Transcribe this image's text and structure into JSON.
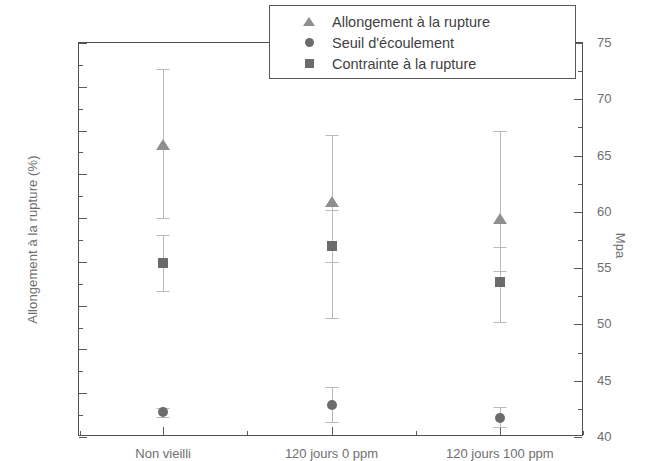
{
  "chart_data": {
    "type": "scatter",
    "title": "",
    "categories": [
      "Non vieilli",
      "120 jours 0 ppm",
      "120 jours 100 ppm"
    ],
    "left_axis": {
      "label": "Allongement à la rupture (%)",
      "ylim": [
        50,
        140
      ],
      "ticks": [
        50,
        60,
        70,
        80,
        90,
        100,
        110,
        120,
        130,
        140
      ],
      "tick_step": 10,
      "minor_per_major": 2
    },
    "right_axis": {
      "label": "Mpa",
      "ylim": [
        40,
        75
      ],
      "ticks": [
        40,
        45,
        50,
        55,
        60,
        65,
        70,
        75
      ],
      "tick_step": 5,
      "minor_per_major": 2
    },
    "grid": false,
    "legend_position": "top-center",
    "series": [
      {
        "name": "Allongement à la rupture",
        "marker": "triangle",
        "color": "#8f8f8f",
        "axis": "left",
        "values": [
          116.7,
          103.7,
          99.8
        ],
        "err_low": [
          16.7,
          13.7,
          11.8
        ],
        "err_high": [
          17.3,
          15.3,
          20.2
        ]
      },
      {
        "name": "Seuil d'écoulement",
        "marker": "circle",
        "color": "#6b6b6b",
        "axis": "right",
        "values": [
          42.2,
          42.8,
          41.7
        ],
        "err_low": [
          0.4,
          1.5,
          0.8
        ],
        "err_high": [
          0.4,
          1.6,
          1.0
        ]
      },
      {
        "name": "Contrainte à la rupture",
        "marker": "square",
        "color": "#6b6b6b",
        "axis": "right",
        "values": [
          55.5,
          57.0,
          53.8
        ],
        "err_low": [
          2.5,
          6.4,
          3.6
        ],
        "err_high": [
          2.4,
          3.2,
          3.1
        ]
      }
    ]
  },
  "legend": {
    "items": [
      {
        "label": "Allongement à la rupture",
        "marker": "triangle"
      },
      {
        "label": "Seuil d'écoulement",
        "marker": "circle"
      },
      {
        "label": "Contrainte à la rupture",
        "marker": "square"
      }
    ]
  }
}
